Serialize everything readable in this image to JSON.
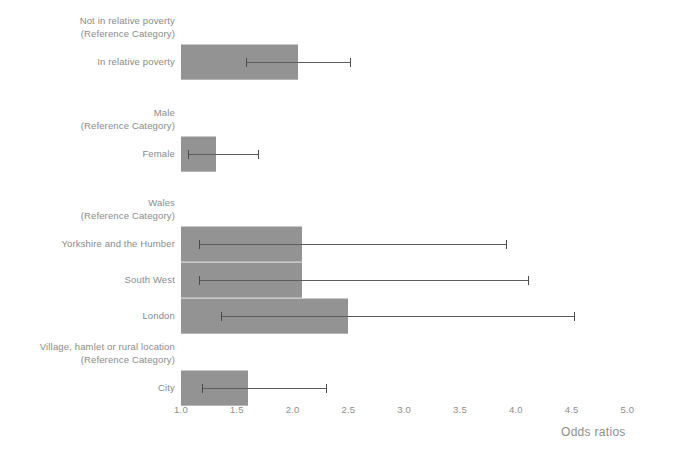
{
  "chart_data": {
    "type": "bar",
    "orientation": "horizontal",
    "title": "",
    "xlabel": "Odds ratios",
    "ylabel": "",
    "xlim": [
      1.0,
      5.0
    ],
    "grid": false,
    "legend": null,
    "tick_labels": [
      "1.0",
      "1.5",
      "2.0",
      "2.5",
      "3.0",
      "3.5",
      "4.0",
      "4.5",
      "5.0"
    ],
    "tick_values": [
      1.0,
      1.5,
      2.0,
      2.5,
      3.0,
      3.5,
      4.0,
      4.5,
      5.0
    ],
    "reference_value": 1.0,
    "groups": [
      {
        "reference_label_line1": "Not in relative poverty",
        "reference_label_line2": "(Reference Category)",
        "categories": [
          {
            "label": "In relative poverty",
            "odds_ratio": 2.05,
            "ci_low": 1.58,
            "ci_high": 2.51
          }
        ]
      },
      {
        "reference_label_line1": "Male",
        "reference_label_line2": "(Reference Category)",
        "categories": [
          {
            "label": "Female",
            "odds_ratio": 1.31,
            "ci_low": 1.06,
            "ci_high": 1.69
          }
        ]
      },
      {
        "reference_label_line1": "Wales",
        "reference_label_line2": "(Reference Category)",
        "categories": [
          {
            "label": "Yorkshire and the Humber",
            "odds_ratio": 2.08,
            "ci_low": 1.16,
            "ci_high": 3.91
          },
          {
            "label": "South West",
            "odds_ratio": 2.08,
            "ci_low": 1.16,
            "ci_high": 4.11
          },
          {
            "label": "London",
            "odds_ratio": 2.5,
            "ci_low": 1.36,
            "ci_high": 4.52
          }
        ]
      },
      {
        "reference_label_line1": "Village, hamlet or rural location",
        "reference_label_line2": "(Reference Category)",
        "categories": [
          {
            "label": "City",
            "odds_ratio": 1.6,
            "ci_low": 1.19,
            "ci_high": 2.3
          }
        ]
      }
    ]
  }
}
